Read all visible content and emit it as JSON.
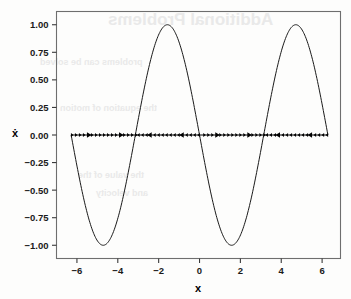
{
  "figure": {
    "name": "phase-line-plot",
    "background_color": "#fdfdfc",
    "frame_color": "#6e6e6e",
    "curve_color": "#1a1a1a",
    "arrow_color": "#000000"
  },
  "ghost_text": {
    "line1": "Additional Problems",
    "line2": "problems can be solved",
    "line3": "the equation of motion",
    "line4": "the value of the",
    "line5": "and velocity"
  },
  "chart_data": {
    "type": "line",
    "title": "",
    "subtitle": "",
    "xlabel": "x",
    "ylabel": "ẋ",
    "xlim": [
      -7.0,
      6.9
    ],
    "ylim": [
      -1.12,
      1.12
    ],
    "grid": false,
    "legend": null,
    "xticks": [
      -6,
      -4,
      -2,
      0,
      2,
      4,
      6
    ],
    "xticklabels": [
      "−6",
      "−4",
      "−2",
      "0",
      "2",
      "4",
      "6"
    ],
    "yticks": [
      1.0,
      0.75,
      0.5,
      0.25,
      0.0,
      -0.25,
      -0.5,
      -0.75,
      -1.0
    ],
    "yticklabels": [
      "1.00",
      "0.75",
      "0.50",
      "0.25",
      "0.00",
      "−0.25",
      "−0.50",
      "−0.75",
      "−1.00"
    ],
    "series": [
      {
        "name": "nullcline",
        "type": "line",
        "function": "-sin(x)",
        "x_start": -6.28,
        "x_end": 6.28,
        "amplitude": 1.0,
        "samples": 400,
        "linewidth": 1.0,
        "color": "#1a1a1a",
        "description": "sinusoid from x=-2pi to x=2pi with peaks at -4.71 and 1.57, troughs at -1.57 and 4.71"
      },
      {
        "name": "phase-line-vector-field",
        "type": "quiver",
        "y_value": 0.0,
        "x_start": -6.28,
        "x_end": 6.28,
        "marker_count": 64,
        "color": "#000000",
        "description": "arrows along x-axis; direction flips at fixed points x = -pi, 0, pi",
        "fixed_points": [
          -6.283,
          -3.142,
          0.0,
          3.142,
          6.283
        ],
        "segments": [
          {
            "from": -6.28,
            "to": -3.14,
            "direction": "right"
          },
          {
            "from": -3.14,
            "to": 0.0,
            "direction": "left"
          },
          {
            "from": 0.0,
            "to": 3.14,
            "direction": "right"
          },
          {
            "from": 3.14,
            "to": 6.28,
            "direction": "left"
          }
        ]
      }
    ],
    "peaks": [
      {
        "x": -4.71,
        "y": 1.0
      },
      {
        "x": 1.57,
        "y": 1.0
      }
    ],
    "troughs": [
      {
        "x": -1.57,
        "y": -1.0
      },
      {
        "x": 4.71,
        "y": -1.0
      }
    ],
    "zero_crossings": [
      -6.28,
      -3.14,
      0.0,
      3.14,
      6.28
    ]
  }
}
